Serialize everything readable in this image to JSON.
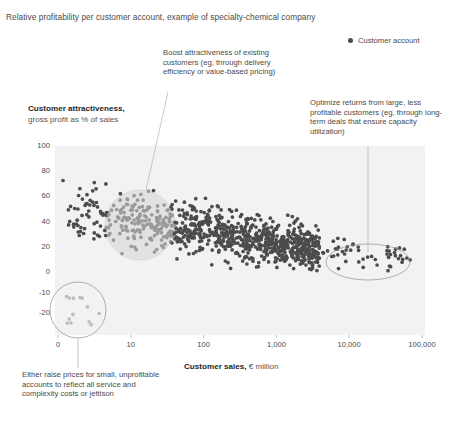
{
  "header": {
    "subtitle": "Relative profitability per customer account, example of specialty-chemical company"
  },
  "legend": {
    "icon": "filled-circle-marker",
    "label": "Customer account",
    "color": "#4c4c4c"
  },
  "annotations": {
    "boost": "Boost attractiveness of existing customers (eg, through delivery efficiency or value-based pricing)",
    "optimize": "Optimize returns from large, less profitable customers (eg, through long-term deals that ensure capacity utilization)",
    "raise_prices": "Either raise prices for small, unprofitable accounts to reflect all service and complexity costs or jettison"
  },
  "chart_data": {
    "type": "scatter",
    "title": "Relative profitability per customer account, example of specialty-chemical company",
    "xlabel_bold": "Customer sales,",
    "xlabel_rest": " € million",
    "ylabel_bold": "Customer attractiveness,",
    "ylabel_rest": "gross profit as % of sales",
    "x_scale": "log",
    "x_ticks": [
      "0",
      "10",
      "100",
      "1,000",
      "10,000",
      "100,000"
    ],
    "x_tick_positions": [
      0,
      1,
      2,
      3,
      4,
      5
    ],
    "y_ticks": [
      "100",
      "80",
      "60",
      "40",
      "20",
      "0",
      "-10",
      "-20"
    ],
    "y_tick_values": [
      100,
      80,
      60,
      40,
      20,
      0,
      -10,
      -20
    ],
    "ylim": [
      -20,
      100
    ],
    "grid": false,
    "legend_position": "top-right",
    "plot_background": "#f2f2f2",
    "marker_color": "#4c4c4c",
    "marker_light_color": "#b9b9b9",
    "series": [
      {
        "name": "Customer account",
        "description": "Dense cloud of ~900 customer accounts; profitability declines as customer sales increase",
        "n_points": 900
      }
    ],
    "highlight_regions": [
      {
        "name": "mid-market-cluster",
        "shape": "circle",
        "style": "filled-light",
        "cx_px": 140,
        "cy_px": 225,
        "r_px": 35,
        "annotation": "boost"
      },
      {
        "name": "large-low-profit-cluster",
        "shape": "ellipse",
        "style": "outline",
        "cx_px": 368,
        "cy_px": 262,
        "rx_px": 42,
        "ry_px": 18,
        "annotation": "optimize"
      },
      {
        "name": "small-unprofitable-cluster",
        "shape": "circle",
        "style": "outline",
        "cx_px": 78,
        "cy_px": 310,
        "r_px": 28,
        "annotation": "raise_prices"
      }
    ]
  }
}
